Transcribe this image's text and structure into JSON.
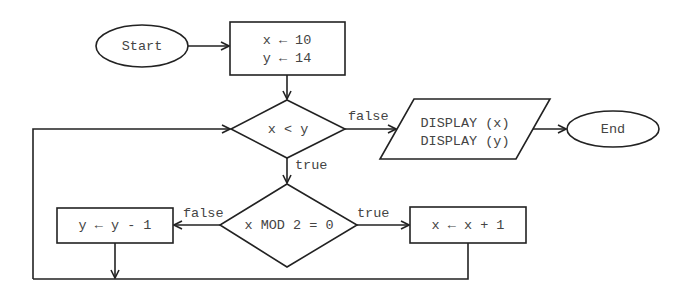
{
  "flowchart": {
    "start": {
      "label": "Start"
    },
    "init": {
      "line1": "x ← 10",
      "line2": "y ← 14"
    },
    "condition1": {
      "label": "x < y",
      "false_label": "false",
      "true_label": "true"
    },
    "output": {
      "line1": "DISPLAY (x)",
      "line2": "DISPLAY (y)"
    },
    "end": {
      "label": "End"
    },
    "condition2": {
      "label": "x MOD 2 = 0",
      "false_label": "false",
      "true_label": "true"
    },
    "decrement": {
      "label": "y ← y - 1"
    },
    "increment": {
      "label": "x ← x + 1"
    }
  }
}
